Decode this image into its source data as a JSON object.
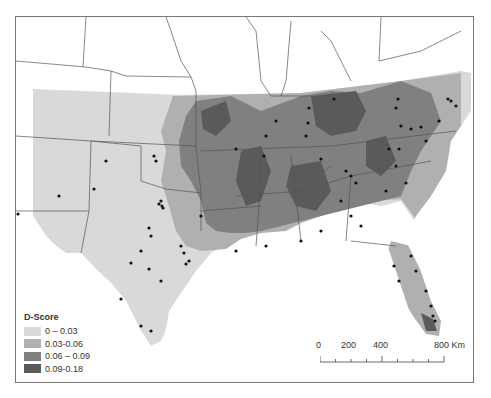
{
  "map": {
    "title": "",
    "region": "Southeastern United States",
    "colors": {
      "class1": "#d9d9d9",
      "class2": "#b0b0b0",
      "class3": "#808080",
      "class4": "#5a5a5a",
      "points": "#111111",
      "borders": "#555555",
      "outside": "#ffffff"
    }
  },
  "legend": {
    "title": "D-Score",
    "items": [
      {
        "label": "0 – 0.03",
        "color": "#d9d9d9"
      },
      {
        "label": "0.03-0.06",
        "color": "#b0b0b0"
      },
      {
        "label": "0.06 – 0.09",
        "color": "#808080"
      },
      {
        "label": "0.09-0.18",
        "color": "#5a5a5a"
      }
    ]
  },
  "scale_bar": {
    "labels": [
      "0",
      "200",
      "400",
      "800 Km"
    ],
    "unit": "Km"
  }
}
